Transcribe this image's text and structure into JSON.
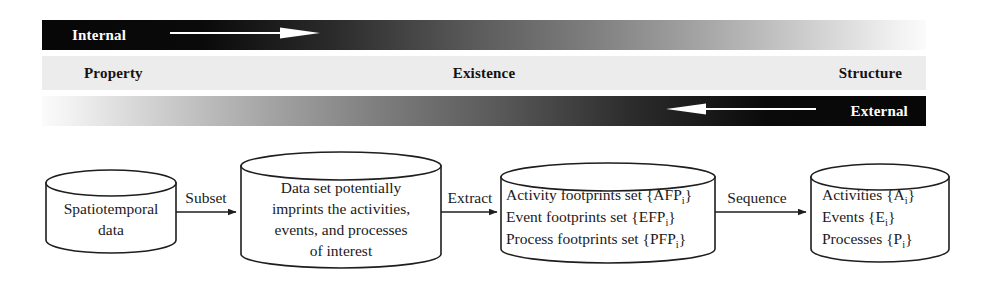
{
  "spectrum": {
    "internal": {
      "label": "Internal",
      "arrow_icon": "arrow-right-icon",
      "direction": "right"
    },
    "external": {
      "label": "External",
      "arrow_icon": "arrow-left-icon",
      "direction": "left"
    },
    "axis_labels": [
      {
        "key": "property",
        "label": "Property"
      },
      {
        "key": "existence",
        "label": "Existence"
      },
      {
        "key": "structure",
        "label": "Structure"
      }
    ],
    "colors": {
      "dark": "#070707",
      "light": "#fbfbfb",
      "middle_band": "#ececec",
      "label_light": "#ffffff",
      "label_dark": "#121212"
    }
  },
  "flow": {
    "nodes": [
      {
        "id": "spatiotemporal-data",
        "lines": [
          [
            {
              "t": "Spatiotemporal"
            }
          ],
          [
            {
              "t": "data"
            }
          ]
        ]
      },
      {
        "id": "data-set-imprints",
        "lines": [
          [
            {
              "t": "Data set potentially"
            }
          ],
          [
            {
              "t": "imprints the activities,"
            }
          ],
          [
            {
              "t": "events, and processes"
            }
          ],
          [
            {
              "t": "of interest"
            }
          ]
        ]
      },
      {
        "id": "footprint-sets",
        "lines": [
          [
            {
              "t": "Activity footprints set {AFP"
            },
            {
              "t": "i",
              "sub": true
            },
            {
              "t": "}"
            }
          ],
          [
            {
              "t": "Event footprints set {EFP"
            },
            {
              "t": "i",
              "sub": true
            },
            {
              "t": "}"
            }
          ],
          [
            {
              "t": "Process footprints set {PFP"
            },
            {
              "t": "i",
              "sub": true
            },
            {
              "t": "}"
            }
          ]
        ]
      },
      {
        "id": "activities-events-processes",
        "lines": [
          [
            {
              "t": "Activities {A"
            },
            {
              "t": "i",
              "sub": true
            },
            {
              "t": "}"
            }
          ],
          [
            {
              "t": "Events {E"
            },
            {
              "t": "i",
              "sub": true
            },
            {
              "t": "}"
            }
          ],
          [
            {
              "t": "Processes {P"
            },
            {
              "t": "i",
              "sub": true
            },
            {
              "t": "}"
            }
          ]
        ]
      }
    ],
    "edges": [
      {
        "id": "edge-subset",
        "label": "Subset"
      },
      {
        "id": "edge-extract",
        "label": "Extract"
      },
      {
        "id": "edge-sequence",
        "label": "Sequence"
      }
    ],
    "colors": {
      "stroke": "#1e1e1e",
      "fill": "#ffffff",
      "text": "#1a1a1a"
    }
  }
}
